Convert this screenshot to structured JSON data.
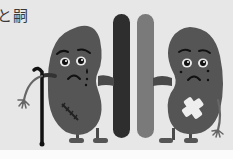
{
  "image": {
    "description": "Grayscale illustration of two sad cartoon kidneys flanking two blood vessels; left kidney holds a cane and has a stitched scar, right kidney has a bandage cross",
    "caption_fragment": "と嗣",
    "colors": {
      "background": "#e7e7e7",
      "bottom_strip": "#fbfbfb",
      "kidney": "#555555",
      "vessel_dark": "#2e2e2e",
      "vessel_light": "#7a7a7a",
      "eye_white": "#e9e9e9",
      "outline": "#111111",
      "bandage": "#eeeeee"
    },
    "figures": [
      {
        "name": "left-kidney",
        "expression": "sad-crying",
        "accessories": [
          "cane",
          "stitched-scar"
        ]
      },
      {
        "name": "right-kidney",
        "expression": "sad-crying",
        "accessories": [
          "bandage-cross"
        ]
      }
    ]
  }
}
